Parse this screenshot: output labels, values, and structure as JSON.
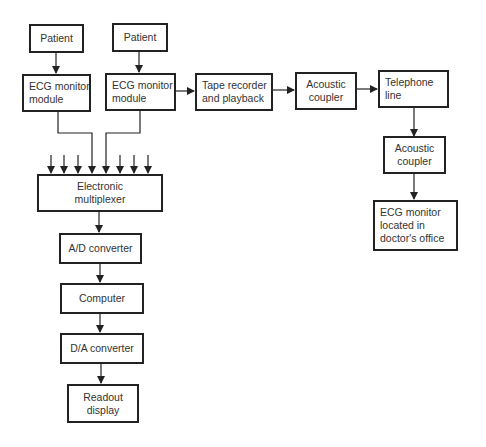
{
  "diagram": {
    "nodes": {
      "patient1": {
        "lines": [
          "Patient"
        ]
      },
      "patient2": {
        "lines": [
          "Patient"
        ]
      },
      "ecg1": {
        "lines": [
          "ECG monitor",
          "module"
        ]
      },
      "ecg2": {
        "lines": [
          "ECG monitor",
          "module"
        ]
      },
      "tape": {
        "lines": [
          "Tape recorder",
          "and playback"
        ]
      },
      "coupler1": {
        "lines": [
          "Acoustic",
          "coupler"
        ]
      },
      "telephone": {
        "lines": [
          "Telephone",
          "line"
        ]
      },
      "coupler2": {
        "lines": [
          "Acoustic",
          "coupler"
        ]
      },
      "doctor": {
        "lines": [
          "ECG monitor",
          "located in",
          "doctor's office"
        ]
      },
      "mux": {
        "lines": [
          "Electronic",
          "multiplexer"
        ]
      },
      "adc": {
        "lines": [
          "A/D converter"
        ]
      },
      "computer": {
        "lines": [
          "Computer"
        ]
      },
      "dac": {
        "lines": [
          "D/A converter"
        ]
      },
      "readout": {
        "lines": [
          "Readout",
          "display"
        ]
      }
    },
    "edges": [
      [
        "patient1",
        "ecg1"
      ],
      [
        "patient2",
        "ecg2"
      ],
      [
        "ecg2",
        "tape"
      ],
      [
        "tape",
        "coupler1"
      ],
      [
        "coupler1",
        "telephone"
      ],
      [
        "telephone",
        "coupler2"
      ],
      [
        "coupler2",
        "doctor"
      ],
      [
        "ecg1",
        "mux"
      ],
      [
        "ecg2",
        "mux"
      ],
      [
        "mux",
        "adc"
      ],
      [
        "adc",
        "computer"
      ],
      [
        "computer",
        "dac"
      ],
      [
        "dac",
        "readout"
      ]
    ],
    "mux_extra_inputs": 6,
    "line_color": "#222222"
  }
}
